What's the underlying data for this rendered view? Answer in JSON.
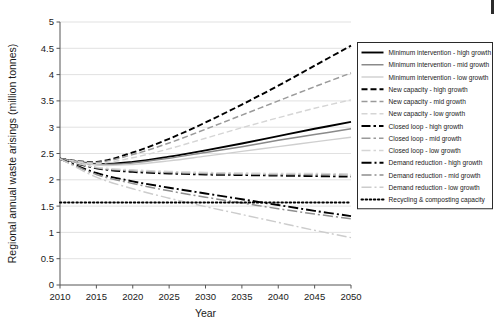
{
  "chart_data": {
    "type": "line",
    "title": "",
    "xlabel": "Year",
    "ylabel": "Regional annual waste arisings (million tonnes)",
    "xlim": [
      2010,
      2050
    ],
    "ylim": [
      0,
      5
    ],
    "xticks": [
      2010,
      2015,
      2020,
      2025,
      2030,
      2035,
      2040,
      2045,
      2050
    ],
    "yticks": [
      0,
      0.5,
      1,
      1.5,
      2,
      2.5,
      3,
      3.5,
      4,
      4.5,
      5
    ],
    "ytick_labels": [
      "0",
      "0.5",
      "1",
      "1.5",
      "2",
      "2.5",
      "3",
      "3.5",
      "4",
      "4.5",
      "5"
    ],
    "grid": "horizontal",
    "legend_position": "right",
    "x": [
      2010,
      2015,
      2020,
      2025,
      2030,
      2035,
      2040,
      2045,
      2050
    ],
    "series": [
      {
        "name": "Minimum intervention - high growth",
        "values": [
          2.4,
          2.3,
          2.34,
          2.44,
          2.56,
          2.69,
          2.83,
          2.97,
          3.1
        ],
        "color": "#000000",
        "width": 1.9,
        "dash": "none"
      },
      {
        "name": "Minimum intervention - mid growth",
        "values": [
          2.4,
          2.29,
          2.32,
          2.41,
          2.52,
          2.63,
          2.75,
          2.86,
          2.97
        ],
        "color": "#8a8a8a",
        "width": 1.5,
        "dash": "none"
      },
      {
        "name": "Minimum intervention - low growth",
        "values": [
          2.4,
          2.28,
          2.29,
          2.36,
          2.45,
          2.54,
          2.63,
          2.72,
          2.81
        ],
        "color": "#cfcfcf",
        "width": 1.4,
        "dash": "none"
      },
      {
        "name": "New capacity - high growth",
        "values": [
          2.4,
          2.34,
          2.52,
          2.78,
          3.09,
          3.43,
          3.79,
          4.17,
          4.55
        ],
        "color": "#000000",
        "width": 1.9,
        "dash": "6,3"
      },
      {
        "name": "New capacity - mid growth",
        "values": [
          2.4,
          2.33,
          2.48,
          2.7,
          2.96,
          3.23,
          3.5,
          3.77,
          4.03
        ],
        "color": "#9a9a9a",
        "width": 1.5,
        "dash": "6,3"
      },
      {
        "name": "New capacity - low growth",
        "values": [
          2.4,
          2.31,
          2.42,
          2.59,
          2.79,
          2.99,
          3.18,
          3.36,
          3.52
        ],
        "color": "#d5d5d5",
        "width": 1.4,
        "dash": "6,3"
      },
      {
        "name": "Closed loop - high growth",
        "values": [
          2.4,
          2.22,
          2.15,
          2.12,
          2.1,
          2.09,
          2.08,
          2.07,
          2.06
        ],
        "color": "#000000",
        "width": 1.9,
        "dash": "9,3,2.5,3"
      },
      {
        "name": "Closed loop - mid growth",
        "values": [
          2.4,
          2.23,
          2.17,
          2.14,
          2.12,
          2.11,
          2.1,
          2.1,
          2.09
        ],
        "color": "#9a9a9a",
        "width": 1.5,
        "dash": "9,3,2.5,3"
      },
      {
        "name": "Closed loop - low growth",
        "values": [
          2.4,
          2.24,
          2.19,
          2.16,
          2.14,
          2.13,
          2.12,
          2.12,
          2.11
        ],
        "color": "#d5d5d5",
        "width": 1.4,
        "dash": "9,3,2.5,3"
      },
      {
        "name": "Demand reduction - high growth",
        "values": [
          2.4,
          2.13,
          1.97,
          1.85,
          1.74,
          1.63,
          1.52,
          1.41,
          1.31
        ],
        "color": "#000000",
        "width": 1.9,
        "dash": "10,3,2,3"
      },
      {
        "name": "Demand reduction - mid growth",
        "values": [
          2.4,
          2.1,
          1.93,
          1.79,
          1.67,
          1.56,
          1.45,
          1.35,
          1.26
        ],
        "color": "#8f8f8f",
        "width": 1.5,
        "dash": "10,3,2,3"
      },
      {
        "name": "Demand reduction - low growth",
        "values": [
          2.4,
          2.05,
          1.83,
          1.65,
          1.49,
          1.34,
          1.19,
          1.04,
          0.9
        ],
        "color": "#cccccc",
        "width": 1.4,
        "dash": "10,3,2,3"
      },
      {
        "name": "Recycling & composting capacity",
        "values": [
          1.57,
          1.57,
          1.57,
          1.57,
          1.57,
          1.57,
          1.57,
          1.57,
          1.57
        ],
        "color": "#000000",
        "width": 2.0,
        "dash": "1.5,2.6"
      }
    ]
  }
}
